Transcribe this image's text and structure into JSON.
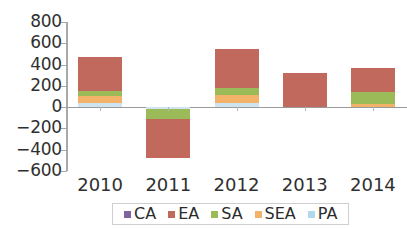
{
  "chart_data": {
    "type": "bar",
    "stacked": true,
    "orientation": "vertical",
    "title": "",
    "xlabel": "",
    "ylabel": "",
    "categories": [
      "2010",
      "2011",
      "2012",
      "2013",
      "2014"
    ],
    "ytick_labels": [
      "800",
      "600",
      "400",
      "200",
      "0",
      "-200",
      "-400",
      "-600"
    ],
    "ytick_values": [
      800,
      600,
      400,
      200,
      0,
      -200,
      -400,
      -600
    ],
    "ylim": [
      -600,
      800
    ],
    "grid": false,
    "legend_position": "bottom",
    "series": [
      {
        "name": "CA",
        "color": "#8064a2",
        "values": [
          0,
          0,
          0,
          0,
          0
        ]
      },
      {
        "name": "EA",
        "color": "#c0695c",
        "values": [
          320,
          -360,
          370,
          320,
          220
        ]
      },
      {
        "name": "SA",
        "color": "#9bbb59",
        "values": [
          50,
          -100,
          65,
          0,
          115
        ]
      },
      {
        "name": "SEA",
        "color": "#f2b26a",
        "values": [
          65,
          0,
          75,
          0,
          30
        ]
      },
      {
        "name": "PA",
        "color": "#cfe3f0",
        "values": [
          40,
          -15,
          40,
          0,
          0
        ]
      }
    ],
    "totals": [
      475,
      -475,
      550,
      320,
      365
    ]
  },
  "legend": {
    "items": [
      {
        "label": "CA",
        "color": "#8064a2"
      },
      {
        "label": "EA",
        "color": "#c0695c"
      },
      {
        "label": "SA",
        "color": "#9bbb59"
      },
      {
        "label": "SEA",
        "color": "#f2b26a"
      },
      {
        "label": "PA",
        "color": "#aed9ee"
      }
    ]
  },
  "axis": {
    "zero_label": "0"
  }
}
